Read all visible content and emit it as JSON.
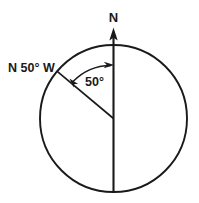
{
  "figure": {
    "type": "bearing-diagram",
    "background_color": "#ffffff",
    "line_color": "#1a1a1a"
  },
  "circle": {
    "center_x": 113.5,
    "center_y": 118.5,
    "radius": 73.5
  },
  "labels": {
    "north": "N",
    "bearing": "N 50° W",
    "angle": "50°"
  },
  "geometry": {
    "north_axis": {
      "from_x": 113.5,
      "from_y": 192,
      "to_y": 28,
      "arrow": "up"
    },
    "bearing_ray": {
      "angle_from_north_deg": 50,
      "direction": "west",
      "end_x": 57,
      "end_y": 71
    },
    "angle_arc": {
      "value_deg": 50,
      "radius": 53,
      "arrowheads": "both"
    }
  }
}
